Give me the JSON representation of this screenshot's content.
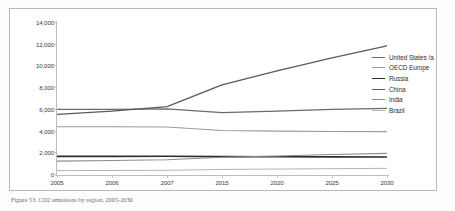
{
  "figure": {
    "caption": "Figure 53. CO2 emissions by region, 2005-2030"
  },
  "chart_data": {
    "type": "line",
    "title": "",
    "xlabel": "",
    "ylabel": "",
    "categories": [
      "2005",
      "2006",
      "2007",
      "2015",
      "2020",
      "2025",
      "2030"
    ],
    "ylim": [
      0,
      14000
    ],
    "yticks": [
      0,
      2000,
      4000,
      6000,
      8000,
      10000,
      12000,
      14000
    ],
    "ytick_labels": [
      "0",
      "2,000",
      "4,000",
      "6,000",
      "8,000",
      "10,000",
      "12,000",
      "14,000"
    ],
    "grid": false,
    "legend_position": "right",
    "series": [
      {
        "name": "United States /a",
        "color": "#6b6b6b",
        "width": 1.3,
        "values": [
          5950,
          5960,
          6000,
          5650,
          5800,
          5950,
          6050
        ]
      },
      {
        "name": "OECD Europe",
        "color": "#9a9a9a",
        "width": 1.1,
        "values": [
          4350,
          4350,
          4330,
          4010,
          3950,
          3920,
          3900
        ]
      },
      {
        "name": "Russia",
        "color": "#2e2e2e",
        "width": 1.6,
        "values": [
          1620,
          1625,
          1630,
          1600,
          1590,
          1580,
          1570
        ]
      },
      {
        "name": "China",
        "color": "#5a5a5a",
        "width": 1.3,
        "values": [
          5500,
          5800,
          6200,
          8200,
          9500,
          10700,
          11800
        ]
      },
      {
        "name": "India",
        "color": "#8d8d8d",
        "width": 1.1,
        "values": [
          1190,
          1250,
          1310,
          1540,
          1660,
          1790,
          1900
        ]
      },
      {
        "name": "Brazil",
        "color": "#b5b5b5",
        "width": 1.0,
        "values": [
          310,
          325,
          340,
          420,
          455,
          490,
          520
        ]
      }
    ]
  }
}
